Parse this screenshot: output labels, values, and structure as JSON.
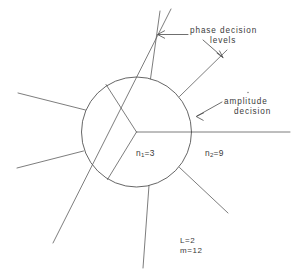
{
  "figure": {
    "background_color": "#ffffff",
    "ink_color": "#4a4a4a",
    "annotations": {
      "phase_decision": {
        "line1": "phase  decision",
        "line2": "levels"
      },
      "amplitude_decision": {
        "line1": "amplitude",
        "line2": "decision"
      }
    },
    "region_labels": {
      "inner": {
        "symbol": "n",
        "subscript": "1",
        "equals": "=3",
        "full": "n1=3"
      },
      "outer": {
        "symbol": "n",
        "subscript": "2",
        "equals": "=9",
        "full": "n2=9"
      }
    },
    "parameters": {
      "line1": "L=2",
      "line2": "m=12"
    },
    "geometry": {
      "circle": {
        "cx": 136.5,
        "cy": 132,
        "r": 55
      },
      "inner_radii_degrees": [
        0,
        120,
        240
      ],
      "outer_spokes_count": 9
    }
  }
}
